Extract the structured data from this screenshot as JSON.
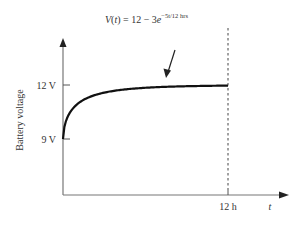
{
  "chart_data": {
    "type": "line",
    "title_parts": {
      "lhs": "V",
      "var": "t",
      "rhs": " = 12 − 3",
      "base": "e",
      "exponent": "−5t/12 hrs"
    },
    "xlabel": "t",
    "ylabel": "Battery voltage",
    "x_ticks": [
      {
        "value": 12,
        "label": "12 h"
      }
    ],
    "y_ticks": [
      {
        "value": 9,
        "label": "9 V"
      },
      {
        "value": 12,
        "label": "12 V"
      }
    ],
    "xlim": [
      0,
      15.2
    ],
    "ylim": [
      7.0,
      12.7
    ],
    "series": [
      {
        "name": "V(t)",
        "formula": "12 - 3*exp(-5t/12)",
        "x": [
          0,
          0.5,
          1,
          2,
          3,
          4,
          5,
          6,
          7,
          8,
          9,
          10,
          11,
          12
        ],
        "values": [
          9.0,
          9.56,
          10.02,
          10.69,
          11.12,
          11.39,
          11.56,
          11.72,
          11.84,
          11.89,
          11.93,
          11.95,
          11.97,
          11.98
        ]
      }
    ],
    "annotations": [
      {
        "type": "vertical-dashed-line",
        "x": 12
      },
      {
        "type": "arrow",
        "points_to": "curve approaching 12 V"
      }
    ],
    "grid": false,
    "legend": "none"
  }
}
